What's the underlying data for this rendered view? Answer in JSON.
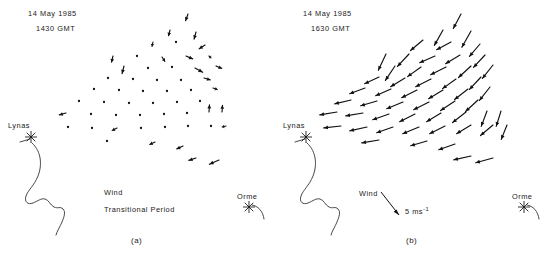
{
  "figure": {
    "type": "wind-vector-field-map-pair",
    "units": "m s-1",
    "stations": [
      "Lynas",
      "Orme"
    ]
  },
  "panel_a": {
    "caption": "(a)",
    "date": "14 May 1985",
    "time": "1430 GMT",
    "wind_label": "Wind",
    "condition_label": "Transitional Period",
    "station_lynas": "Lynas",
    "station_orme": "Orme"
  },
  "panel_b": {
    "caption": "(b)",
    "date": "14 May 1985",
    "time": "1630 GMT",
    "wind_label": "Wind",
    "scale_label": "5 ms",
    "scale_exponent": "-1",
    "station_lynas": "Lynas",
    "station_orme": "Orme"
  },
  "chart_data": {
    "type": "scatter",
    "xlabel": "",
    "ylabel": "",
    "grid": false,
    "legend": "none",
    "series": [
      {
        "name": "1430 GMT Transitional Period",
        "panel": "a",
        "note": "Mostly near-calm (dot) observations; few short vectors. Scale 5 m/s = 24 px.",
        "vectors": [
          {
            "x": 188,
            "y": 14,
            "u": -0.5,
            "v": 1.4
          },
          {
            "x": 170,
            "y": 30,
            "u": -0.3,
            "v": 1.2
          },
          {
            "x": 196,
            "y": 32,
            "u": -0.4,
            "v": 1.5
          },
          {
            "x": 153,
            "y": 42,
            "u": -0.2,
            "v": 0.9
          },
          {
            "x": 176,
            "y": 42,
            "u": 0.1,
            "v": 0.5
          },
          {
            "x": 205,
            "y": 45,
            "u": -1.2,
            "v": 0.8
          },
          {
            "x": 113,
            "y": 56,
            "u": -0.3,
            "v": 1.3
          },
          {
            "x": 137,
            "y": 56,
            "u": 0.2,
            "v": 0.5
          },
          {
            "x": 162,
            "y": 57,
            "u": 0.6,
            "v": 0.9
          },
          {
            "x": 186,
            "y": 56,
            "u": 1.4,
            "v": 0.6
          },
          {
            "x": 209,
            "y": 56,
            "u": 0.4,
            "v": 0.4
          },
          {
            "x": 124,
            "y": 66,
            "u": -0.4,
            "v": 1.6
          },
          {
            "x": 148,
            "y": 68,
            "u": 0.3,
            "v": 0.3
          },
          {
            "x": 172,
            "y": 67,
            "u": 0.2,
            "v": 0.4
          },
          {
            "x": 195,
            "y": 68,
            "u": 1.6,
            "v": 0.9
          },
          {
            "x": 216,
            "y": 66,
            "u": 1.2,
            "v": 0.5
          },
          {
            "x": 108,
            "y": 78,
            "u": 0.1,
            "v": 0.3
          },
          {
            "x": 133,
            "y": 79,
            "u": 0.2,
            "v": 0.4
          },
          {
            "x": 157,
            "y": 80,
            "u": 0.3,
            "v": 0.3
          },
          {
            "x": 181,
            "y": 80,
            "u": 0.4,
            "v": 0.3
          },
          {
            "x": 204,
            "y": 78,
            "u": 1.3,
            "v": 0.4
          },
          {
            "x": 94,
            "y": 89,
            "u": 0.2,
            "v": 0.3
          },
          {
            "x": 119,
            "y": 90,
            "u": 0.2,
            "v": 0.3
          },
          {
            "x": 143,
            "y": 91,
            "u": 0.2,
            "v": 0.3
          },
          {
            "x": 167,
            "y": 91,
            "u": 0.3,
            "v": 0.3
          },
          {
            "x": 191,
            "y": 90,
            "u": 0.3,
            "v": 0.3
          },
          {
            "x": 213,
            "y": 88,
            "u": 0.9,
            "v": 0.3
          },
          {
            "x": 79,
            "y": 101,
            "u": 0.2,
            "v": 0.3
          },
          {
            "x": 104,
            "y": 102,
            "u": 0.2,
            "v": 0.3
          },
          {
            "x": 129,
            "y": 103,
            "u": 0.2,
            "v": 0.3
          },
          {
            "x": 153,
            "y": 103,
            "u": 0.2,
            "v": 0.3
          },
          {
            "x": 177,
            "y": 102,
            "u": 0.3,
            "v": 0.3
          },
          {
            "x": 200,
            "y": 101,
            "u": 0.3,
            "v": 0.3
          },
          {
            "x": 66,
            "y": 113,
            "u": -1.4,
            "v": 0.4
          },
          {
            "x": 91,
            "y": 114,
            "u": 0.2,
            "v": 0.3
          },
          {
            "x": 116,
            "y": 115,
            "u": 0.2,
            "v": 0.3
          },
          {
            "x": 140,
            "y": 115,
            "u": 0.2,
            "v": 0.3
          },
          {
            "x": 164,
            "y": 114,
            "u": 0.2,
            "v": 0.3
          },
          {
            "x": 187,
            "y": 113,
            "u": 0.2,
            "v": 0.3
          },
          {
            "x": 209,
            "y": 112,
            "u": 0.1,
            "v": -1.5
          },
          {
            "x": 222,
            "y": 112,
            "u": 0.1,
            "v": -1.4
          },
          {
            "x": 68,
            "y": 127,
            "u": 0.2,
            "v": 0.3
          },
          {
            "x": 92,
            "y": 128,
            "u": 0.2,
            "v": 0.3
          },
          {
            "x": 117,
            "y": 128,
            "u": -1.0,
            "v": 0.5
          },
          {
            "x": 141,
            "y": 128,
            "u": 0.2,
            "v": 0.3
          },
          {
            "x": 165,
            "y": 127,
            "u": 0.2,
            "v": 0.3
          },
          {
            "x": 188,
            "y": 126,
            "u": 0.2,
            "v": 0.3
          },
          {
            "x": 211,
            "y": 126,
            "u": 0.2,
            "v": 0.3
          },
          {
            "x": 226,
            "y": 126,
            "u": -0.8,
            "v": 0.2
          },
          {
            "x": 107,
            "y": 141,
            "u": 0.2,
            "v": 0.3
          },
          {
            "x": 155,
            "y": 142,
            "u": -1.1,
            "v": 0.5
          },
          {
            "x": 183,
            "y": 146,
            "u": -1.3,
            "v": 0.6
          },
          {
            "x": 196,
            "y": 158,
            "u": -1.5,
            "v": 0.5
          },
          {
            "x": 219,
            "y": 160,
            "u": -2.0,
            "v": 0.9
          }
        ]
      },
      {
        "name": "1630 GMT",
        "panel": "b",
        "note": "Well-developed flow; long vectors directed mainly toward lower-left/left. Scale 5 m/s = 24 px.",
        "vectors": [
          {
            "x": 186,
            "y": 14,
            "u": -1.6,
            "v": 3.0
          },
          {
            "x": 168,
            "y": 30,
            "u": -1.8,
            "v": 3.2
          },
          {
            "x": 196,
            "y": 31,
            "u": -1.9,
            "v": 3.4
          },
          {
            "x": 148,
            "y": 40,
            "u": -2.6,
            "v": 2.2
          },
          {
            "x": 176,
            "y": 42,
            "u": -3.0,
            "v": 1.6
          },
          {
            "x": 205,
            "y": 44,
            "u": -2.2,
            "v": 2.6
          },
          {
            "x": 111,
            "y": 54,
            "u": -1.6,
            "v": 3.4
          },
          {
            "x": 134,
            "y": 54,
            "u": -2.4,
            "v": 2.6
          },
          {
            "x": 160,
            "y": 56,
            "u": -3.2,
            "v": 1.4
          },
          {
            "x": 185,
            "y": 55,
            "u": -3.0,
            "v": 1.8
          },
          {
            "x": 210,
            "y": 55,
            "u": -2.4,
            "v": 2.6
          },
          {
            "x": 120,
            "y": 66,
            "u": -2.0,
            "v": 3.0
          },
          {
            "x": 146,
            "y": 67,
            "u": -2.8,
            "v": 2.0
          },
          {
            "x": 171,
            "y": 67,
            "u": -3.2,
            "v": 1.6
          },
          {
            "x": 196,
            "y": 66,
            "u": -2.6,
            "v": 2.4
          },
          {
            "x": 218,
            "y": 65,
            "u": -2.2,
            "v": 2.8
          },
          {
            "x": 104,
            "y": 77,
            "u": -3.0,
            "v": 1.4
          },
          {
            "x": 130,
            "y": 78,
            "u": -3.0,
            "v": 1.8
          },
          {
            "x": 156,
            "y": 79,
            "u": -3.2,
            "v": 1.6
          },
          {
            "x": 181,
            "y": 79,
            "u": -2.8,
            "v": 2.0
          },
          {
            "x": 206,
            "y": 77,
            "u": -2.4,
            "v": 2.6
          },
          {
            "x": 90,
            "y": 88,
            "u": -3.2,
            "v": 1.2
          },
          {
            "x": 116,
            "y": 89,
            "u": -3.2,
            "v": 1.4
          },
          {
            "x": 142,
            "y": 90,
            "u": -3.2,
            "v": 1.6
          },
          {
            "x": 168,
            "y": 90,
            "u": -3.0,
            "v": 1.8
          },
          {
            "x": 193,
            "y": 89,
            "u": -2.8,
            "v": 2.2
          },
          {
            "x": 215,
            "y": 87,
            "u": -2.2,
            "v": 2.8
          },
          {
            "x": 76,
            "y": 100,
            "u": -3.4,
            "v": 0.8
          },
          {
            "x": 102,
            "y": 101,
            "u": -3.4,
            "v": 1.0
          },
          {
            "x": 128,
            "y": 102,
            "u": -3.4,
            "v": 1.4
          },
          {
            "x": 154,
            "y": 102,
            "u": -3.2,
            "v": 1.6
          },
          {
            "x": 180,
            "y": 101,
            "u": -3.0,
            "v": 2.0
          },
          {
            "x": 203,
            "y": 100,
            "u": -2.6,
            "v": 2.4
          },
          {
            "x": 62,
            "y": 112,
            "u": -3.6,
            "v": 0.6
          },
          {
            "x": 88,
            "y": 113,
            "u": -3.6,
            "v": 0.6
          },
          {
            "x": 114,
            "y": 114,
            "u": -3.4,
            "v": 1.2
          },
          {
            "x": 140,
            "y": 114,
            "u": -3.2,
            "v": 1.6
          },
          {
            "x": 166,
            "y": 113,
            "u": -3.0,
            "v": 1.8
          },
          {
            "x": 191,
            "y": 112,
            "u": -2.8,
            "v": 2.2
          },
          {
            "x": 212,
            "y": 111,
            "u": -1.2,
            "v": 3.2
          },
          {
            "x": 226,
            "y": 111,
            "u": -1.0,
            "v": 3.2
          },
          {
            "x": 66,
            "y": 126,
            "u": -3.6,
            "v": 0.4
          },
          {
            "x": 92,
            "y": 127,
            "u": -3.6,
            "v": 0.8
          },
          {
            "x": 118,
            "y": 127,
            "u": -3.4,
            "v": 1.2
          },
          {
            "x": 144,
            "y": 127,
            "u": -3.4,
            "v": 1.4
          },
          {
            "x": 170,
            "y": 126,
            "u": -3.2,
            "v": 1.6
          },
          {
            "x": 196,
            "y": 125,
            "u": -3.0,
            "v": 1.8
          },
          {
            "x": 218,
            "y": 125,
            "u": -2.6,
            "v": 2.2
          },
          {
            "x": 232,
            "y": 125,
            "u": -1.2,
            "v": 3.0
          },
          {
            "x": 104,
            "y": 140,
            "u": -3.6,
            "v": 0.6
          },
          {
            "x": 152,
            "y": 141,
            "u": -3.4,
            "v": 1.0
          },
          {
            "x": 180,
            "y": 144,
            "u": -3.4,
            "v": 1.2
          },
          {
            "x": 196,
            "y": 156,
            "u": -3.6,
            "v": 0.8
          },
          {
            "x": 218,
            "y": 158,
            "u": -3.6,
            "v": 1.0
          }
        ]
      }
    ]
  }
}
